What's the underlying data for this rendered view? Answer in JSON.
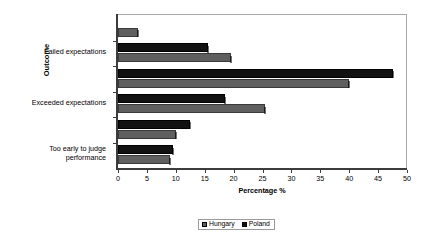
{
  "chart_data": {
    "type": "bar",
    "orientation": "horizontal",
    "title": "",
    "xlabel": "Percentage %",
    "ylabel": "Outcome",
    "xlim": [
      0,
      50
    ],
    "xticks": [
      0,
      5,
      10,
      15,
      20,
      25,
      30,
      35,
      40,
      45,
      50
    ],
    "grid": false,
    "legend_position": "bottom",
    "categories": [
      "",
      "Failed expectations",
      "",
      "Exceeded expectations",
      "",
      "Too early to judge performance"
    ],
    "visible_category_labels": [
      "Failed expectations",
      "Exceeded expectations",
      "Too early to judge performance"
    ],
    "series": [
      {
        "name": "Hungary",
        "color": "#5f5f5f",
        "values": [
          3.5,
          19.5,
          40.0,
          25.5,
          10.0,
          9.0
        ]
      },
      {
        "name": "Poland",
        "color": "#121212",
        "values": [
          0.0,
          15.5,
          47.5,
          18.5,
          12.5,
          9.5
        ]
      }
    ]
  },
  "legend": {
    "items": [
      {
        "label": "Hungary",
        "color": "#5f5f5f"
      },
      {
        "label": "Poland",
        "color": "#121212"
      }
    ]
  },
  "colors": {
    "hungary": "#5f5f5f",
    "poland": "#121212",
    "axis": "#3c3c3c",
    "frame": "#a8a8a8",
    "background": "#ffffff"
  }
}
